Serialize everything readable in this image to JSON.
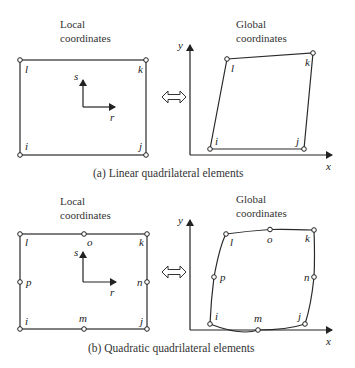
{
  "panels": [
    {
      "id": "a",
      "caption": "(a)  Linear quadrilateral elements",
      "local": {
        "title_line1": "Local",
        "title_line2": "coordinates",
        "nodes": {
          "l": "l",
          "k": "k",
          "i": "i",
          "j": "j"
        },
        "axes": {
          "s": "s",
          "r": "r"
        }
      },
      "global": {
        "title_line1": "Global",
        "title_line2": "coordinates",
        "nodes": {
          "l": "l",
          "k": "k",
          "i": "i",
          "j": "j"
        },
        "axes": {
          "x": "x",
          "y": "y"
        }
      },
      "mapping_symbol": "double-arrow"
    },
    {
      "id": "b",
      "caption": "(b)  Quadratic quadrilateral elements",
      "local": {
        "title_line1": "Local",
        "title_line2": "coordinates",
        "nodes": {
          "l": "l",
          "o": "o",
          "k": "k",
          "p": "p",
          "n": "n",
          "i": "i",
          "m": "m",
          "j": "j"
        },
        "axes": {
          "s": "s",
          "r": "r"
        }
      },
      "global": {
        "title_line1": "Global",
        "title_line2": "coordinates",
        "nodes": {
          "l": "l",
          "o": "o",
          "k": "k",
          "p": "p",
          "n": "n",
          "i": "i",
          "m": "m",
          "j": "j"
        },
        "axes": {
          "x": "x",
          "y": "y"
        }
      },
      "mapping_symbol": "double-arrow"
    }
  ],
  "colors": {
    "line": "#2a2a2a",
    "node_fill": "#ffffff",
    "background": "#ffffff"
  }
}
